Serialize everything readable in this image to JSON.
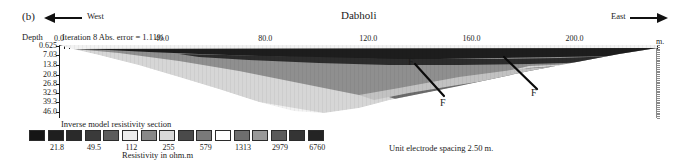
{
  "figure": {
    "panel_label": "(b)",
    "title": "Dabholi",
    "west_label": "West",
    "east_label": "East",
    "iteration_text": "Iteration 8 Abs. error = 1.11%",
    "depth_axis_label": "Depth",
    "distance_unit": "m.",
    "spacing_note": "Unit electrode spacing 2.50 m.",
    "fault_labels": [
      "F",
      "F",
      "F"
    ]
  },
  "axes": {
    "x_ticks": [
      "0.0",
      "40.0",
      "80.0",
      "120.0",
      "160.0",
      "200.0"
    ],
    "x_tick_values": [
      0,
      40,
      80,
      120,
      160,
      200
    ],
    "x_range": [
      0,
      232
    ],
    "y_ticks": [
      "0.625",
      "7.03",
      "13.8",
      "20.8",
      "26.8",
      "32.9",
      "39.3",
      "46.0"
    ],
    "y_tick_values": [
      0.625,
      7.03,
      13.8,
      20.8,
      26.8,
      32.9,
      39.3,
      46.0
    ],
    "y_range": [
      0,
      50
    ]
  },
  "legend": {
    "title": "Inverse model resistivity section",
    "axis_label": "Resistivity in ohm.m",
    "labels": [
      "21.8",
      "49.5",
      "112",
      "255",
      "579",
      "1313",
      "2979",
      "6760"
    ],
    "colors": [
      "#151515",
      "#1f1f1f",
      "#2a2a2a",
      "#3a3a3a",
      "#5c5c5c",
      "#ebebeb",
      "#888888",
      "#d8d8d8",
      "#4a4a4a",
      "#7a7a7a",
      "#fdfdfd",
      "#6e6e6e",
      "#9a9a9a",
      "#5a5a5a",
      "#343434",
      "#242424"
    ]
  },
  "chart_data": {
    "type": "heatmap",
    "title": "Dabholi",
    "xlabel": "m.",
    "ylabel": "Depth",
    "subtitle": "Iteration 8 Abs. error = 1.11%",
    "grid": false,
    "legend_position": "bottom-left",
    "colorbar": {
      "label": "Resistivity in ohm.m",
      "ticks": [
        21.8,
        49.5,
        112,
        255,
        579,
        1313,
        2979,
        6760
      ],
      "scale": "log",
      "n_classes": 16
    },
    "xlim": [
      0,
      232
    ],
    "ylim": [
      0,
      50
    ],
    "layers": [
      {
        "name": "near-surface-high-resistivity",
        "tone": "#1d1d1d",
        "description": "dark continuous top band spanning full profile, thickest between 90 and 170 m"
      },
      {
        "name": "intermediate-layer",
        "tone": "#666666",
        "description": "mid-gray layer beneath the top band, deepening eastward"
      },
      {
        "name": "low-resistivity-body",
        "tone": "#c9c9c9",
        "description": "light gray wedge thickening toward the centre of the section"
      },
      {
        "name": "basement-unresolved",
        "tone": "#ffffff",
        "description": "white region below the inverted model"
      }
    ],
    "annotations": [
      {
        "label": "F",
        "x": 150,
        "y": 6,
        "type": "fault"
      },
      {
        "label": "F",
        "x": 160,
        "y": 34,
        "type": "fault"
      },
      {
        "label": "F",
        "x": 184,
        "y": 26,
        "type": "fault"
      }
    ]
  }
}
